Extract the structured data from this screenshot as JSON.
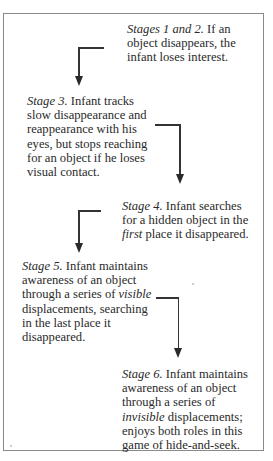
{
  "diagram": {
    "type": "flow",
    "stages": [
      {
        "id": 1,
        "label": "Stages 1 and 2.",
        "lines": [
          {
            "label": "Stages 1 and 2.",
            "rest": " If an"
          },
          {
            "text": "object disappears, the"
          },
          {
            "text": "infant loses interest."
          }
        ],
        "full_text": "Stages 1 and 2. If an object disappears, the infant loses interest."
      },
      {
        "id": 3,
        "label": "Stage 3.",
        "lines": [
          {
            "label": "Stage 3.",
            "rest": " Infant tracks"
          },
          {
            "text": "slow disappearance and"
          },
          {
            "text": "reappearance with his"
          },
          {
            "text": "eyes, but stops reaching"
          },
          {
            "text": "for an object if he loses"
          },
          {
            "text": "visual contact."
          }
        ],
        "full_text": "Stage 3. Infant tracks slow disappearance and reappearance with his eyes, but stops reaching for an object if he loses visual contact."
      },
      {
        "id": 4,
        "label": "Stage 4.",
        "lines": [
          {
            "label": "Stage 4.",
            "rest": " Infant searches"
          },
          {
            "text": "for a hidden object in the"
          },
          {
            "italic": "first",
            "rest": " place it disappeared."
          }
        ],
        "full_text": "Stage 4. Infant searches for a hidden object in the first place it disappeared."
      },
      {
        "id": 5,
        "label": "Stage 5.",
        "lines": [
          {
            "label": "Stage 5.",
            "rest": " Infant maintains"
          },
          {
            "text": "awareness of an object"
          },
          {
            "pre": "through a series of ",
            "italic": "visible"
          },
          {
            "text": "displacements, searching"
          },
          {
            "text": "in the last place it"
          },
          {
            "text": "disappeared."
          }
        ],
        "full_text": "Stage 5. Infant maintains awareness of an object through a series of visible displacements, searching in the last place it disappeared."
      },
      {
        "id": 6,
        "label": "Stage 6.",
        "lines": [
          {
            "label": "Stage 6.",
            "rest": " Infant maintains"
          },
          {
            "text": "awareness of an object"
          },
          {
            "text": "through a series of"
          },
          {
            "italic": "invisible",
            "rest": " displacements;"
          },
          {
            "text": "enjoys both roles in this"
          },
          {
            "text": "game of hide-and-seek."
          }
        ],
        "full_text": "Stage 6. Infant maintains awareness of an object through a series of invisible displacements; enjoys both roles in this game of hide-and-seek."
      }
    ],
    "connectors": [
      {
        "from": "Stages 1 and 2",
        "to": "Stage 3",
        "direction": "down-left"
      },
      {
        "from": "Stage 3",
        "to": "Stage 4",
        "direction": "down-right"
      },
      {
        "from": "Stage 4",
        "to": "Stage 5",
        "direction": "down-left"
      },
      {
        "from": "Stage 5",
        "to": "Stage 6",
        "direction": "down-right"
      }
    ],
    "colors": {
      "text": "#2a2a2a",
      "border": "#8a8a8a",
      "arrow": "#2a2a2a",
      "background": "#ffffff"
    }
  }
}
